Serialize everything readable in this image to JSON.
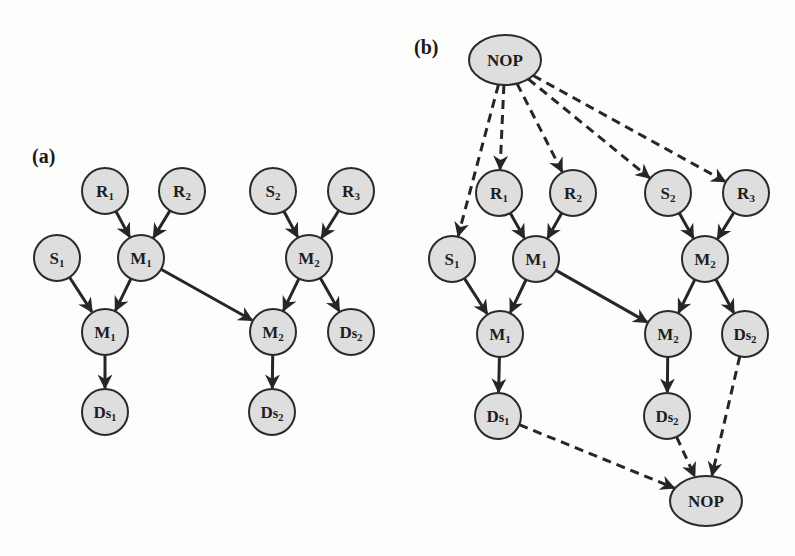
{
  "figure": {
    "panels": [
      {
        "id": "a",
        "label": "(a)",
        "nodes": [
          {
            "id": "a_R1",
            "base": "R",
            "sub": "1",
            "x": 105,
            "y": 191
          },
          {
            "id": "a_R2",
            "base": "R",
            "sub": "2",
            "x": 182,
            "y": 191
          },
          {
            "id": "a_S2",
            "base": "S",
            "sub": "2",
            "x": 273,
            "y": 191
          },
          {
            "id": "a_R3",
            "base": "R",
            "sub": "3",
            "x": 351,
            "y": 191
          },
          {
            "id": "a_S1",
            "base": "S",
            "sub": "1",
            "x": 57,
            "y": 258
          },
          {
            "id": "a_M1top",
            "base": "M",
            "sub": "1",
            "x": 141,
            "y": 258
          },
          {
            "id": "a_M2top",
            "base": "M",
            "sub": "2",
            "x": 309,
            "y": 258
          },
          {
            "id": "a_M1bot",
            "base": "M",
            "sub": "1",
            "x": 105,
            "y": 332
          },
          {
            "id": "a_M2bot",
            "base": "M",
            "sub": "2",
            "x": 273,
            "y": 332
          },
          {
            "id": "a_Ds2r",
            "base": "Ds",
            "sub": "2",
            "x": 351,
            "y": 332
          },
          {
            "id": "a_Ds1",
            "base": "Ds",
            "sub": "1",
            "x": 105,
            "y": 412
          },
          {
            "id": "a_Ds2",
            "base": "Ds",
            "sub": "2",
            "x": 272,
            "y": 412
          }
        ],
        "edges": [
          {
            "from": "a_R1",
            "to": "a_M1top",
            "style": "solid"
          },
          {
            "from": "a_R2",
            "to": "a_M1top",
            "style": "solid"
          },
          {
            "from": "a_S2",
            "to": "a_M2top",
            "style": "solid"
          },
          {
            "from": "a_R3",
            "to": "a_M2top",
            "style": "solid"
          },
          {
            "from": "a_S1",
            "to": "a_M1bot",
            "style": "solid"
          },
          {
            "from": "a_M1top",
            "to": "a_M1bot",
            "style": "solid"
          },
          {
            "from": "a_M1top",
            "to": "a_M2bot",
            "style": "solid"
          },
          {
            "from": "a_M2top",
            "to": "a_M2bot",
            "style": "solid"
          },
          {
            "from": "a_M2top",
            "to": "a_Ds2r",
            "style": "solid"
          },
          {
            "from": "a_M1bot",
            "to": "a_Ds1",
            "style": "solid"
          },
          {
            "from": "a_M2bot",
            "to": "a_Ds2",
            "style": "solid"
          }
        ]
      },
      {
        "id": "b",
        "label": "(b)",
        "nodes": [
          {
            "id": "b_NOPtop",
            "base": "NOP",
            "sub": "",
            "x": 505,
            "y": 60,
            "shape": "ellipse"
          },
          {
            "id": "b_R1",
            "base": "R",
            "sub": "1",
            "x": 499,
            "y": 193
          },
          {
            "id": "b_R2",
            "base": "R",
            "sub": "2",
            "x": 573,
            "y": 193
          },
          {
            "id": "b_S2",
            "base": "S",
            "sub": "2",
            "x": 668,
            "y": 193
          },
          {
            "id": "b_R3",
            "base": "R",
            "sub": "3",
            "x": 746,
            "y": 193
          },
          {
            "id": "b_S1",
            "base": "S",
            "sub": "1",
            "x": 452,
            "y": 259
          },
          {
            "id": "b_M1top",
            "base": "M",
            "sub": "1",
            "x": 536,
            "y": 259
          },
          {
            "id": "b_M2top",
            "base": "M",
            "sub": "2",
            "x": 705,
            "y": 259
          },
          {
            "id": "b_M1bot",
            "base": "M",
            "sub": "1",
            "x": 500,
            "y": 334
          },
          {
            "id": "b_M2bot",
            "base": "M",
            "sub": "2",
            "x": 668,
            "y": 334
          },
          {
            "id": "b_Ds2r",
            "base": "Ds",
            "sub": "2",
            "x": 745,
            "y": 334
          },
          {
            "id": "b_Ds1",
            "base": "Ds",
            "sub": "1",
            "x": 498,
            "y": 416
          },
          {
            "id": "b_Ds2",
            "base": "Ds",
            "sub": "2",
            "x": 667,
            "y": 416
          },
          {
            "id": "b_NOPbot",
            "base": "NOP",
            "sub": "",
            "x": 706,
            "y": 501,
            "shape": "ellipse"
          }
        ],
        "edges": [
          {
            "from": "b_NOPtop",
            "to": "b_S1",
            "style": "dashed"
          },
          {
            "from": "b_NOPtop",
            "to": "b_R1",
            "style": "dashed"
          },
          {
            "from": "b_NOPtop",
            "to": "b_R2",
            "style": "dashed"
          },
          {
            "from": "b_NOPtop",
            "to": "b_S2",
            "style": "dashed"
          },
          {
            "from": "b_NOPtop",
            "to": "b_R3",
            "style": "dashed"
          },
          {
            "from": "b_R1",
            "to": "b_M1top",
            "style": "solid"
          },
          {
            "from": "b_R2",
            "to": "b_M1top",
            "style": "solid"
          },
          {
            "from": "b_S2",
            "to": "b_M2top",
            "style": "solid"
          },
          {
            "from": "b_R3",
            "to": "b_M2top",
            "style": "solid"
          },
          {
            "from": "b_S1",
            "to": "b_M1bot",
            "style": "solid"
          },
          {
            "from": "b_M1top",
            "to": "b_M1bot",
            "style": "solid"
          },
          {
            "from": "b_M1top",
            "to": "b_M2bot",
            "style": "solid"
          },
          {
            "from": "b_M2top",
            "to": "b_M2bot",
            "style": "solid"
          },
          {
            "from": "b_M2top",
            "to": "b_Ds2r",
            "style": "solid"
          },
          {
            "from": "b_M1bot",
            "to": "b_Ds1",
            "style": "solid"
          },
          {
            "from": "b_M2bot",
            "to": "b_Ds2",
            "style": "solid"
          },
          {
            "from": "b_Ds1",
            "to": "b_NOPbot",
            "style": "dashed"
          },
          {
            "from": "b_Ds2",
            "to": "b_NOPbot",
            "style": "dashed"
          },
          {
            "from": "b_Ds2r",
            "to": "b_NOPbot",
            "style": "dashed"
          }
        ]
      }
    ],
    "labels": {
      "a": {
        "text": "(a)",
        "x": 32,
        "y": 163
      },
      "b": {
        "text": "(b)",
        "x": 414,
        "y": 54
      }
    },
    "colors": {
      "node_fill": "#dedede",
      "stroke": "#2a2a2a",
      "background": "#fdfdfc"
    }
  }
}
